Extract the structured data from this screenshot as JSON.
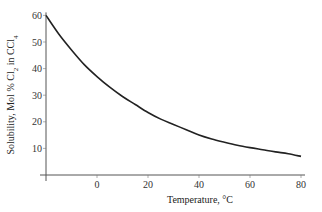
{
  "chart_data": {
    "type": "line",
    "title": "",
    "xlabel": "Temperature, °C",
    "ylabel": "Solubility, Mol % Cl2 in CCl4",
    "ylabel_parts": {
      "pre": "Solubility, Mol % Cl",
      "sub1": "2",
      "mid": " in CCl",
      "sub2": "4"
    },
    "xlim": [
      -20,
      80
    ],
    "ylim": [
      0,
      60
    ],
    "x_ticks": [
      0,
      20,
      40,
      60,
      80
    ],
    "y_ticks": [
      10,
      20,
      30,
      40,
      50,
      60
    ],
    "grid": false,
    "legend": null,
    "series": [
      {
        "name": "Cl2 solubility in CCl4",
        "x": [
          -20,
          -15,
          -10,
          -5,
          0,
          5,
          10,
          15,
          20,
          25,
          30,
          35,
          40,
          45,
          50,
          55,
          60,
          65,
          70,
          75,
          80
        ],
        "values": [
          60,
          53,
          47,
          41.5,
          37,
          33,
          29.5,
          26.5,
          23.5,
          21,
          19,
          17,
          15,
          13.5,
          12.3,
          11.2,
          10.3,
          9.5,
          8.7,
          8,
          7
        ]
      }
    ]
  }
}
